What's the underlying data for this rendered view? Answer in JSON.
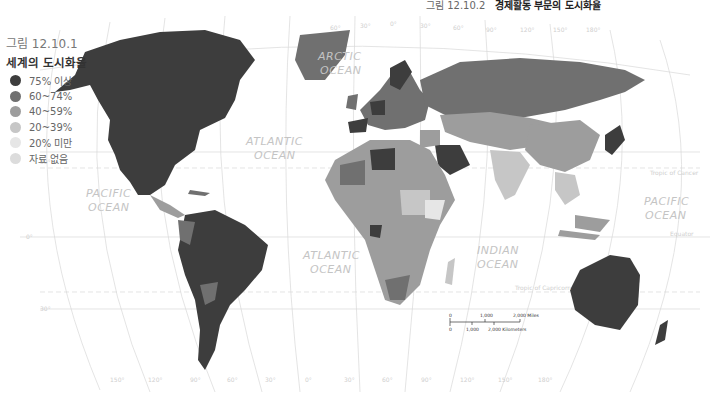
{
  "top_caption": {
    "number": "그림 12.10.2",
    "title": "경제활동 부문의 도시화율"
  },
  "legend": {
    "figure_number": "그림 12.10.1",
    "title": "세계의 도시화율",
    "items": [
      {
        "label": "75% 이상",
        "color": "#3d3d3d"
      },
      {
        "label": "60~74%",
        "color": "#707070"
      },
      {
        "label": "40~59%",
        "color": "#9d9d9d"
      },
      {
        "label": "20~39%",
        "color": "#c6c6c6"
      },
      {
        "label": "20% 미만",
        "color": "#e6e6e6"
      },
      {
        "label": "자료 없음",
        "color": "#dcdcdc"
      }
    ]
  },
  "oceans": [
    {
      "name": "ARCTIC",
      "line2": "OCEAN"
    },
    {
      "name": "ATLANTIC",
      "line2": "OCEAN"
    },
    {
      "name": "PACIFIC",
      "line2": "OCEAN"
    },
    {
      "name": "ATLANTIC",
      "line2": "OCEAN"
    },
    {
      "name": "INDIAN",
      "line2": "OCEAN"
    },
    {
      "name": "PACIFIC",
      "line2": "OCEAN"
    }
  ],
  "reference_lines": {
    "tropic_cancer": "Tropic of Cancer",
    "equator": "Equator",
    "tropic_capricorn": "Tropic of Capricorn"
  },
  "latitude_labels": [
    "30°",
    "0°",
    "30°"
  ],
  "longitude_labels_bottom": [
    "150°",
    "120°",
    "90°",
    "60°",
    "30°",
    "0°",
    "30°",
    "60°",
    "90°",
    "120°",
    "150°",
    "180°"
  ],
  "longitude_labels_top": [
    "60°",
    "30°",
    "0°",
    "30°",
    "60°",
    "90°",
    "120°",
    "150°",
    "180°"
  ],
  "scale_bar": {
    "miles": [
      "0",
      "1,000",
      "2,000 Miles"
    ],
    "kilometers": [
      "0",
      "1,000",
      "2,000 Kilometers"
    ]
  }
}
